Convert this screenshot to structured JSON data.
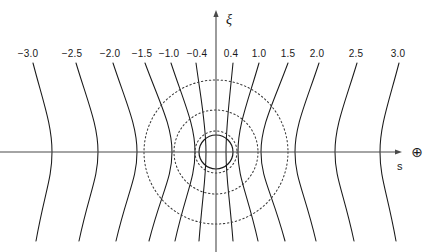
{
  "figure": {
    "background_color": "#ffffff",
    "line_color": "#1a1a1a",
    "dotted_color": "#3a3a3a",
    "axis_color": "#4a4a4a",
    "width": 433,
    "height": 252
  },
  "axes": {
    "vertical": {
      "label": "ξ",
      "label_x": 226,
      "label_y": 12,
      "x": 216,
      "y_top": 14,
      "y_bottom": 252
    },
    "horizontal": {
      "label": "s",
      "label_x": 397,
      "label_y": 160,
      "y": 152,
      "x_left": 0,
      "x_right": 398
    },
    "origin": {
      "x": 216,
      "y": 152
    }
  },
  "markers": {
    "planet_symbol": "⊕",
    "planet_symbol_x": 417,
    "planet_symbol_y": 152,
    "planet_symbol_name": "earth-symbol"
  },
  "chart_data": {
    "type": "line",
    "title": "",
    "xlabel": "s",
    "ylabel": "ξ",
    "grid": false,
    "legend": null,
    "tick_labels": [
      "-3.0",
      "-2.5",
      "-2.0",
      "-1.5",
      "-1.0",
      "-0.4",
      "0.4",
      "1.0",
      "1.5",
      "2.0",
      "2.5",
      "3.0"
    ],
    "tick_values": [
      -3.0,
      -2.5,
      -2.0,
      -1.5,
      -1.0,
      -0.4,
      0.4,
      1.0,
      1.5,
      2.0,
      2.5,
      3.0
    ],
    "tick_label_y": 48,
    "tick_label_x": [
      28,
      72,
      110,
      142,
      169,
      197,
      231,
      259,
      288,
      317,
      356,
      398
    ],
    "field_lines": [
      {
        "label": "-3.0",
        "top_x": 33,
        "mid_x": 52,
        "bottom_x": 36
      },
      {
        "label": "-2.5",
        "top_x": 76,
        "mid_x": 98,
        "bottom_x": 79
      },
      {
        "label": "-2.0",
        "top_x": 113,
        "mid_x": 137,
        "bottom_x": 116
      },
      {
        "label": "-1.5",
        "top_x": 145,
        "mid_x": 172,
        "bottom_x": 149
      },
      {
        "label": "-1.0",
        "top_x": 171,
        "mid_x": 195,
        "bottom_x": 175
      },
      {
        "label": "-0.4",
        "top_x": 196,
        "mid_x": 206,
        "bottom_x": 199
      },
      {
        "label": "0.4",
        "top_x": 233,
        "mid_x": 226,
        "bottom_x": 233
      },
      {
        "label": "1.0",
        "top_x": 259,
        "mid_x": 238,
        "bottom_x": 258
      },
      {
        "label": "1.5",
        "top_x": 288,
        "mid_x": 261,
        "bottom_x": 285
      },
      {
        "label": "2.0",
        "top_x": 319,
        "mid_x": 295,
        "bottom_x": 316
      },
      {
        "label": "2.5",
        "top_x": 357,
        "mid_x": 335,
        "bottom_x": 354
      },
      {
        "label": "3.0",
        "top_x": 399,
        "mid_x": 380,
        "bottom_x": 396
      }
    ],
    "shells": [
      {
        "name": "outer-shell",
        "radius": 72,
        "style": "dotted"
      },
      {
        "name": "middle-shell",
        "radius": 42,
        "style": "dotted"
      },
      {
        "name": "inner-shell",
        "radius": 21,
        "style": "dotted"
      }
    ],
    "body": {
      "name": "central-body",
      "radius": 17,
      "style": "solid"
    },
    "line_top_y": 63,
    "line_bottom_y": 241
  }
}
